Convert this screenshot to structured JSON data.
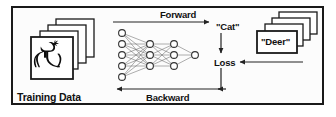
{
  "diagram": {
    "colors": {
      "frame": "#1a1a1a",
      "ink": "#111111",
      "card_fill": "#ffffff",
      "card_stroke": "#1a1a1a",
      "node_fill": "#ffffff",
      "node_stroke": "#333333",
      "edge": "#555555",
      "background": "#fcfcfc"
    },
    "labels": {
      "forward": "Forward",
      "backward": "Backward",
      "prediction": "\"Cat\"",
      "loss": "Loss",
      "ground_truth": "\"Deer\"",
      "training_data": "Training Data"
    },
    "training_data_stack": {
      "card_count": 4,
      "image_subject": "deer-silhouette"
    },
    "ground_truth_stack": {
      "card_count": 4,
      "front_label": "\"Deer\""
    },
    "network": {
      "layers": [
        {
          "name": "input",
          "nodes": 5
        },
        {
          "name": "hidden-1",
          "nodes": 3
        },
        {
          "name": "hidden-2",
          "nodes": 3
        },
        {
          "name": "output",
          "nodes": 1
        }
      ]
    },
    "flow": [
      {
        "from": "training-data",
        "to": "prediction",
        "label": "Forward"
      },
      {
        "from": "prediction",
        "to": "loss",
        "label": ""
      },
      {
        "from": "ground-truth",
        "to": "loss",
        "label": ""
      },
      {
        "from": "loss",
        "to": "training-data",
        "label": "Backward"
      }
    ]
  }
}
